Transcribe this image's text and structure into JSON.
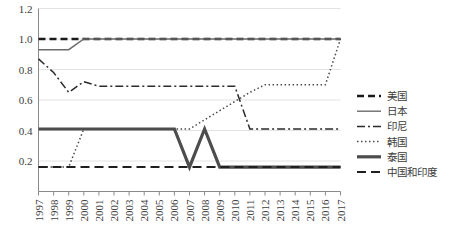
{
  "chart_data": {
    "type": "line",
    "title": "",
    "xlabel": "",
    "ylabel": "",
    "grid": true,
    "legend_position": "right",
    "xlim": [
      1997,
      2017
    ],
    "ylim": [
      0,
      1.2
    ],
    "ytick_labels": [
      "1.2",
      "1.0",
      "0.8",
      "0.6",
      "0.4",
      "0.2"
    ],
    "ytick_values": [
      1.2,
      1.0,
      0.8,
      0.6,
      0.4,
      0.2
    ],
    "categories": [
      "1997",
      "1998",
      "1999",
      "2000",
      "2001",
      "2002",
      "2003",
      "2004",
      "2005",
      "2006",
      "2007",
      "2008",
      "2009",
      "2010",
      "2011",
      "2012",
      "2013",
      "2014",
      "2015",
      "2016",
      "2017"
    ],
    "series": [
      {
        "name": "美国",
        "style": "dashed",
        "color": "#1a1a1a",
        "width": 2.4,
        "dash": "7,4",
        "values": [
          1.0,
          1.0,
          1.0,
          1.0,
          1.0,
          1.0,
          1.0,
          1.0,
          1.0,
          1.0,
          1.0,
          1.0,
          1.0,
          1.0,
          1.0,
          1.0,
          1.0,
          1.0,
          1.0,
          1.0,
          1.0
        ]
      },
      {
        "name": "日本",
        "style": "solid",
        "color": "#6b6b6b",
        "width": 1.4,
        "dash": "",
        "values": [
          0.93,
          0.93,
          0.93,
          1.0,
          1.0,
          1.0,
          1.0,
          1.0,
          1.0,
          1.0,
          1.0,
          1.0,
          1.0,
          1.0,
          1.0,
          1.0,
          1.0,
          1.0,
          1.0,
          1.0,
          1.0
        ]
      },
      {
        "name": "印尼",
        "style": "dash-dot",
        "color": "#2b2b2b",
        "width": 1.5,
        "dash": "8,3,2,3",
        "values": [
          0.87,
          0.78,
          0.65,
          0.72,
          0.69,
          0.69,
          0.69,
          0.69,
          0.69,
          0.69,
          0.69,
          0.69,
          0.69,
          0.69,
          0.41,
          0.41,
          0.41,
          0.41,
          0.41,
          0.41,
          0.41
        ]
      },
      {
        "name": "韩国",
        "style": "dotted",
        "color": "#4a4a4a",
        "width": 1.5,
        "dash": "1.5,2.5",
        "values": [
          0.16,
          0.16,
          0.16,
          0.41,
          0.41,
          0.41,
          0.41,
          0.41,
          0.41,
          0.41,
          0.41,
          0.47,
          0.53,
          0.59,
          0.65,
          0.7,
          0.7,
          0.7,
          0.7,
          0.7,
          1.0
        ]
      },
      {
        "name": "泰国",
        "style": "thick-solid",
        "color": "#4d4d4d",
        "width": 3.2,
        "dash": "",
        "values": [
          0.41,
          0.41,
          0.41,
          0.41,
          0.41,
          0.41,
          0.41,
          0.41,
          0.41,
          0.41,
          0.16,
          0.41,
          0.16,
          0.16,
          0.16,
          0.16,
          0.16,
          0.16,
          0.16,
          0.16,
          0.16
        ]
      },
      {
        "name": "中国和印度",
        "style": "long-dash",
        "color": "#1f1f1f",
        "width": 2.0,
        "dash": "9,5",
        "values": [
          0.16,
          0.16,
          0.16,
          0.16,
          0.16,
          0.16,
          0.16,
          0.16,
          0.16,
          0.16,
          0.16,
          0.16,
          0.16,
          0.16,
          0.16,
          0.16,
          0.16,
          0.16,
          0.16,
          0.16,
          0.16
        ]
      }
    ]
  },
  "legend": {
    "items": [
      {
        "label": "美国"
      },
      {
        "label": "日本"
      },
      {
        "label": "印尼"
      },
      {
        "label": "韩国"
      },
      {
        "label": "泰国"
      },
      {
        "label": "中国和印度"
      }
    ]
  },
  "colors": {
    "axis": "#8a8a8a",
    "grid": "#e2e2e2",
    "text": "#3c3c3c",
    "background": "#ffffff"
  }
}
